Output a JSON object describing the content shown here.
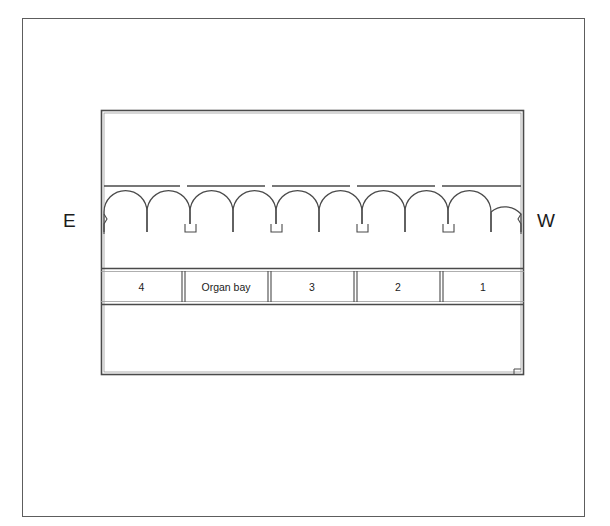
{
  "drawing": {
    "title": "Church nave floor plan with arcade",
    "type": "architectural-plan",
    "background_color": "#ffffff",
    "line_color": "#4a4a4a",
    "text_color": "#1c1c1c"
  },
  "compass": {
    "east_label": "E",
    "west_label": "W"
  },
  "bay_row": {
    "cells": [
      {
        "label": "4",
        "x": 0,
        "width": 81
      },
      {
        "label": "Organ bay",
        "x": 83,
        "width": 84
      },
      {
        "label": "3",
        "x": 169,
        "width": 84
      },
      {
        "label": "2",
        "x": 255,
        "width": 84
      },
      {
        "label": "1",
        "x": 341,
        "width": 82
      }
    ]
  },
  "arcade": {
    "arch_count": 10,
    "pier_count": 4,
    "pair_count": 5,
    "springing_y": 232,
    "wall_line_y": 186
  },
  "plan_geometry": {
    "outer_frame": {
      "x": 22,
      "y": 18,
      "width": 563,
      "height": 499
    },
    "plan_rect": {
      "x": 101,
      "y": 110,
      "width": 423,
      "height": 265
    }
  }
}
